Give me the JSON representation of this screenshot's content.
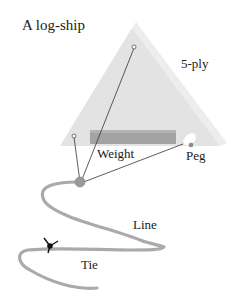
{
  "diagram": {
    "title": "A log-ship",
    "labels": {
      "board": "5-ply",
      "weight": "Weight",
      "peg": "Peg",
      "line": "Line",
      "tie": "Tie"
    },
    "colors": {
      "board_face": "#e2e2e2",
      "board_edge": "#ececec",
      "weight_bar": "#9e9e9e",
      "rope": "#a8a8a8",
      "knot": "#9a9a9a",
      "tie_marker": "#111111",
      "text": "#1a1a1a"
    }
  }
}
